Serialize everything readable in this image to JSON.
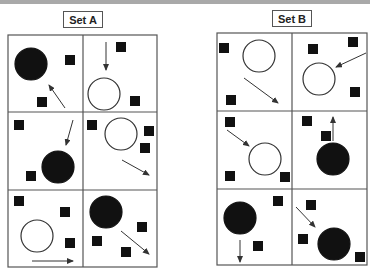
{
  "sets": [
    {
      "label": "Set A",
      "label_box": {
        "x": 63,
        "y": 11,
        "w": 38
      },
      "grid": {
        "x": 8,
        "y": 35,
        "w": 149,
        "h": 232,
        "col_split": 83,
        "row_splits": [
          112,
          190
        ]
      },
      "panels": [
        {
          "circles": [
            {
              "cx": 31,
              "cy": 64,
              "r": 16,
              "filled": true
            }
          ],
          "squares": [
            [
              65,
              55
            ],
            [
              37,
              97
            ]
          ],
          "arrows": [
            [
              65,
              108,
              49,
              85
            ]
          ]
        },
        {
          "circles": [
            {
              "cx": 104,
              "cy": 94,
              "r": 16,
              "filled": false
            }
          ],
          "squares": [
            [
              116,
              42
            ],
            [
              130,
              96
            ]
          ],
          "arrows": [
            [
              106,
              42,
              106,
              70
            ]
          ]
        },
        {
          "circles": [
            {
              "cx": 58,
              "cy": 167,
              "r": 16,
              "filled": true
            }
          ],
          "squares": [
            [
              14,
              120
            ],
            [
              26,
              171
            ]
          ],
          "arrows": [
            [
              73,
              120,
              66,
              145
            ]
          ]
        },
        {
          "circles": [
            {
              "cx": 121,
              "cy": 134,
              "r": 16,
              "filled": false
            }
          ],
          "squares": [
            [
              87,
              120
            ],
            [
              144,
              126
            ],
            [
              140,
              143
            ]
          ],
          "arrows": [
            [
              122,
              160,
              149,
              175
            ]
          ]
        },
        {
          "circles": [
            {
              "cx": 37,
              "cy": 236,
              "r": 16,
              "filled": false
            }
          ],
          "squares": [
            [
              14,
              196
            ],
            [
              60,
              207
            ],
            [
              65,
              238
            ]
          ],
          "arrows": [
            [
              32,
              261,
              73,
              261
            ]
          ]
        },
        {
          "circles": [
            {
              "cx": 106,
              "cy": 212,
              "r": 16,
              "filled": true
            }
          ],
          "squares": [
            [
              137,
              222
            ],
            [
              92,
              236
            ],
            [
              121,
              247
            ]
          ],
          "arrows": [
            [
              121,
              231,
              149,
              254
            ]
          ]
        }
      ]
    },
    {
      "label": "Set B",
      "label_box": {
        "x": 272,
        "y": 10,
        "w": 38
      },
      "grid": {
        "x": 217,
        "y": 33,
        "w": 150,
        "h": 232,
        "col_split": 292,
        "row_splits": [
          111,
          189
        ]
      },
      "panels": [
        {
          "circles": [
            {
              "cx": 259,
              "cy": 56,
              "r": 16,
              "filled": false
            }
          ],
          "squares": [
            [
              219,
              43
            ],
            [
              226,
              95
            ]
          ],
          "arrows": [
            [
              244,
              78,
              278,
              103
            ]
          ]
        },
        {
          "circles": [
            {
              "cx": 319,
              "cy": 79,
              "r": 16,
              "filled": false
            }
          ],
          "squares": [
            [
              308,
              44
            ],
            [
              348,
              37
            ],
            [
              350,
              87
            ]
          ],
          "arrows": [
            [
              366,
              53,
              336,
              67
            ]
          ]
        },
        {
          "circles": [
            {
              "cx": 265,
              "cy": 159,
              "r": 16,
              "filled": false
            }
          ],
          "squares": [
            [
              225,
              117
            ],
            [
              225,
              171
            ],
            [
              280,
              172
            ]
          ],
          "arrows": [
            [
              227,
              130,
              249,
              146
            ]
          ]
        },
        {
          "circles": [
            {
              "cx": 333,
              "cy": 159,
              "r": 16,
              "filled": true
            }
          ],
          "squares": [
            [
              302,
              116
            ],
            [
              321,
              131
            ]
          ],
          "arrows": [
            [
              333,
              141,
              333,
              117
            ]
          ]
        },
        {
          "circles": [
            {
              "cx": 240,
              "cy": 218,
              "r": 16,
              "filled": true
            }
          ],
          "squares": [
            [
              273,
              196
            ],
            [
              253,
              241
            ]
          ],
          "arrows": [
            [
              240,
              240,
              240,
              262
            ]
          ]
        },
        {
          "circles": [
            {
              "cx": 334,
              "cy": 244,
              "r": 16,
              "filled": true
            }
          ],
          "squares": [
            [
              306,
              200
            ],
            [
              298,
              234
            ],
            [
              355,
              252
            ]
          ],
          "arrows": [
            [
              296,
              207,
              315,
              227
            ]
          ]
        }
      ]
    }
  ],
  "colors": {
    "line": "#555555",
    "fill": "#111111",
    "label_border": "#555555",
    "top_strip": "#a9a9a9"
  }
}
